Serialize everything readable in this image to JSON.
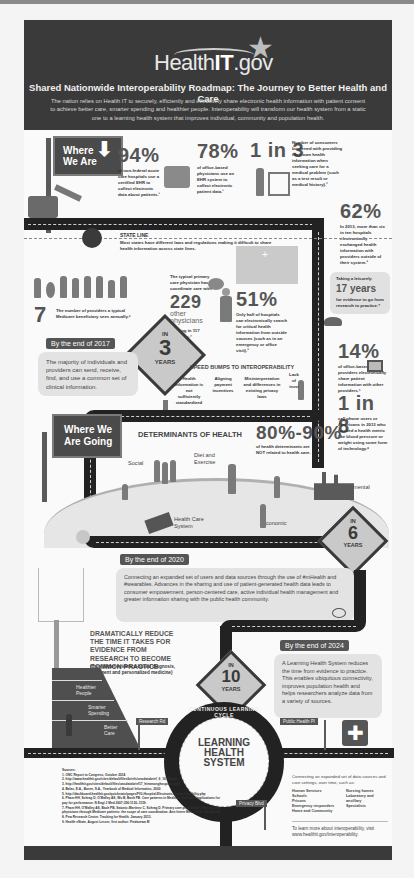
{
  "header": {
    "logo_prefix": "Health",
    "logo_bold": "IT",
    "logo_suffix": ".gov",
    "title": "Shared Nationwide Interoperability Roadmap: The Journey to Better Health and Care",
    "description": "The nation relies on Health IT to securely, efficiently and effectively share electronic health information with patient consent to achieve better care, smarter spending and healthier people. Interoperability will transform our health system from a static one to a learning health system that improves individual, community and population health."
  },
  "where_we_are": {
    "sign_label": "Where We Are",
    "stats": [
      {
        "value": "94%",
        "text": "of non-federal acute care hospitals use a certified EHR to collect electronic data about patients.¹"
      },
      {
        "value": "78%",
        "text": "of office-based physicians use an EHR system to collect electronic patient data.¹"
      },
      {
        "value": "1 in 3",
        "text": "Number of consumers burdened with providing their own health information when seeking care for a medical problem (such as a test result or medical history).²"
      },
      {
        "value": "62%",
        "text": "In 2013, more than six in ten hospitals electronically exchanged health information with providers outside of their system.³"
      }
    ],
    "state_line": {
      "title": "STATE LINE",
      "text": "Most states have different laws and regulations making it difficult to share health information across state lines."
    },
    "providers": {
      "value": "7",
      "text": "The number of providers a typical Medicare beneficiary sees annually.⁶"
    },
    "physicians": {
      "intro": "The typical primary care physician has to coordinate care with",
      "value": "229",
      "label": "other physicians",
      "text": "working in 117 practices.⁷"
    },
    "hospitals": {
      "value": "51%",
      "text": "Only half of hospitals can electronically search for critical health information from outside sources (such as in an emergency or office visit).³"
    },
    "evidence": {
      "intro": "Taking a leisurely",
      "value": "17 years",
      "text": "for evidence to go from research to practice.⁴"
    },
    "office_based": {
      "value": "14%",
      "text": "of office-based providers electronically share patient information with other providers.⁵"
    },
    "tracking": {
      "value": "1 in 8",
      "text": "cell phone users or Americans in 2013 who tracked a health metric like blood pressure or weight using some form of technology.⁸"
    }
  },
  "milestone_2017": {
    "sign_in": "IN",
    "sign_num": "3",
    "sign_unit": "YEARS",
    "tag": "By the end of 2017",
    "text": "The majority of individuals and providers can send, receive, find, and use a common set of clinical information."
  },
  "speed_bumps": {
    "title": "SPEED BUMPS TO INTEROPERABILITY",
    "items": [
      "Health information is not sufficiently standardized",
      "Aligning payment incentives",
      "Misinterpretation and differences in existing privacy laws",
      "Lack of trust"
    ]
  },
  "where_we_are_going": {
    "sign_label": "Where We Are Going",
    "determinants_title": "DETERMINANTS OF HEALTH",
    "determinants_value": "80%-90%",
    "determinants_text": "of health determinants are NOT related to health care.",
    "labels": [
      "Social",
      "Diet and Exercise",
      "Environmental",
      "Health Care System",
      "Economic"
    ]
  },
  "milestone_2020": {
    "sign_in": "IN",
    "sign_num": "6",
    "sign_unit": "YEARS",
    "tag": "By the end of 2020",
    "text": "Connecting an expanded set of users and data sources through the use of #mHealth and #wearables. Advances in the sharing and use of patient-generated health data leads to consumer empowerment, person-centered care, active individual health management and greater information sharing with the public health community."
  },
  "evidence_block": {
    "title": "DRAMATICALLY REDUCE THE TIME IT TAKES FOR EVIDENCE FROM RESEARCH TO BECOME COMMON PRACTICE",
    "subtitle": "(thus better evidence-based diagnosis, treatment and personalized medicine)",
    "ramp_labels": [
      "Healthier People",
      "Smarter Spending",
      "Better Care"
    ]
  },
  "milestone_2024": {
    "sign_in": "IN",
    "sign_num": "10",
    "sign_unit": "YEARS",
    "tag": "By the end of 2024",
    "text": "A Learning Health System reduces the time from evidence to practice. This enables ubiquitous connectivity, improves population health and helps researchers analyze data from a variety of sources."
  },
  "learning_cycle": {
    "ring_label": "CONTINUOUS LEARNING CYCLE",
    "center_line1": "LEARNING",
    "center_line2": "HEALTH",
    "center_line3": "SYSTEM",
    "street_signs": [
      "Research Rd",
      "Public Health Pl",
      "Privacy Blvd"
    ]
  },
  "sources": {
    "title": "Sources:",
    "items": [
      "1. ONC Report to Congress, October 2014",
      "2. http://www.healthit.gov/sites/default/files/briefs/oncdatabrief_9_16_14.pdf",
      "3. http://healthit.gov/sites/default/files/oncdatabrief17_hieamonghospitals.pdf",
      "4. Balas, E.A., Boren, S.A., Yearbook of Medical Informatics, 2000",
      "5. http://dashboard.healthit.gov/quickstats/pages/FIG-Hospital-Electronic-Query-Capability.php",
      "6. Pham HH, Schrag D, O'Malley AS, Wu B, Bach PB. Care patterns in Medicare and their implications for pay for performance. N Engl J Med 2007;356:1130–1139.",
      "7. Pham HH, O'Malley AS, Bach PB, Saiontz-Martinez C, Schrag D. Primary care physicians' links to other physicians through Medicare patients: the scope of care coordination. Ann Intern Med. 2009; 150:236–42",
      "8. Pew Research Center. Tracking for Health. January 2013.",
      "9. Health eState, August Lesser, first author: Fiedazewa M"
    ]
  },
  "data_sources": {
    "intro": "Connecting an expanded set of data sources and care settings, over time, such as:",
    "col1": [
      "Human Services",
      "Schools",
      "Prisons",
      "Emergency responders",
      "Home and Community"
    ],
    "col2": [
      "Nursing homes",
      "Laboratory and ancillary",
      "Specialists"
    ],
    "learn_more": "To learn more about interoperability, visit www.healthit.gov/interoperability."
  },
  "colors": {
    "dark": "#3a3a3a",
    "road": "#222222",
    "bubble": "#e3e3e3",
    "sign_fill": "#c9c9c9"
  }
}
